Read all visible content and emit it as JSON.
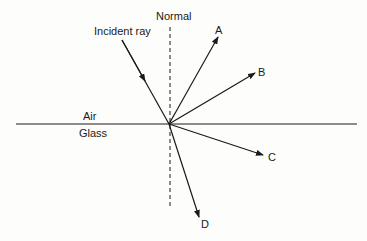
{
  "diagram": {
    "labels": {
      "normal": "Normal",
      "incident_ray": "Incident ray",
      "air": "Air",
      "glass": "Glass",
      "ray_a": "A",
      "ray_b": "B",
      "ray_c": "C",
      "ray_d": "D"
    },
    "colors": {
      "line": "#1a1a1a",
      "background": "#fdfdfb"
    }
  }
}
